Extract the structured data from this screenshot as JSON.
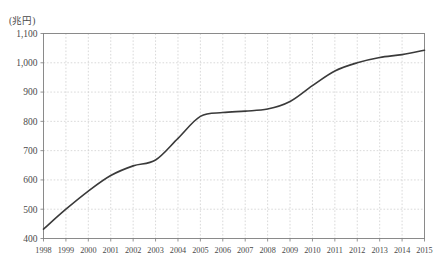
{
  "chart_data": {
    "type": "line",
    "title": "",
    "subtitle": "",
    "xlabel": "",
    "ylabel": "",
    "unit_label": "(兆円)",
    "grid": true,
    "legend": "none",
    "xlim": [
      1998,
      2015
    ],
    "ylim": [
      400,
      1100
    ],
    "ytick_step": 100,
    "ytick_labels": [
      "1,100",
      "1,000",
      "900",
      "800",
      "700",
      "600",
      "500",
      "400"
    ],
    "ytick_values": [
      1100,
      1000,
      900,
      800,
      700,
      600,
      500,
      400
    ],
    "categories": [
      "1998",
      "1999",
      "2000",
      "2001",
      "2002",
      "2003",
      "2004",
      "2005",
      "2006",
      "2007",
      "2008",
      "2009",
      "2010",
      "2011",
      "2012",
      "2013",
      "2014",
      "2015"
    ],
    "x": [
      1998,
      1999,
      2000,
      2001,
      2002,
      2003,
      2004,
      2005,
      2006,
      2007,
      2008,
      2009,
      2010,
      2011,
      2012,
      2013,
      2014,
      2015
    ],
    "values": [
      432,
      500,
      562,
      615,
      648,
      668,
      742,
      817,
      830,
      835,
      842,
      868,
      922,
      972,
      1000,
      1018,
      1028,
      1043
    ],
    "series": [
      {
        "name": "",
        "color": "#3a3a3a",
        "values": [
          432,
          500,
          562,
          615,
          648,
          668,
          742,
          817,
          830,
          835,
          842,
          868,
          922,
          972,
          1000,
          1018,
          1028,
          1043
        ]
      }
    ],
    "colors": {
      "line": "#3a3a3a",
      "axis": "#7a7a7a",
      "grid": "#c9c9c9",
      "text": "#4a4a4a",
      "background": "#ffffff"
    }
  }
}
